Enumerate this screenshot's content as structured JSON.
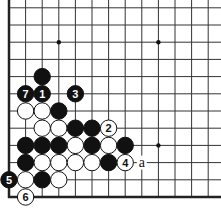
{
  "diagram": {
    "type": "go-board-fragment",
    "board_size": 19,
    "visible_corner": "bottom-left",
    "colors": {
      "background": "#ffffff",
      "line": "#333333",
      "edge": "#222222",
      "black": "#111111",
      "white": "#ffffff"
    },
    "grid": {
      "origin_x": 9,
      "origin_y": 197,
      "step_x": 16.6,
      "step_y": 17.2,
      "cols_visible": 13,
      "rows_visible": 12
    },
    "star_points": [
      {
        "col": 4,
        "row": 4
      },
      {
        "col": 10,
        "row": 4
      },
      {
        "col": 4,
        "row": 10
      },
      {
        "col": 10,
        "row": 10
      }
    ],
    "stones": [
      {
        "col": 3,
        "row": 8,
        "color": "black",
        "label": ""
      },
      {
        "col": 2,
        "row": 7,
        "color": "black",
        "label": "7"
      },
      {
        "col": 3,
        "row": 7,
        "color": "black",
        "label": "1"
      },
      {
        "col": 5,
        "row": 7,
        "color": "black",
        "label": "3"
      },
      {
        "col": 2,
        "row": 6,
        "color": "white",
        "label": ""
      },
      {
        "col": 3,
        "row": 6,
        "color": "white",
        "label": ""
      },
      {
        "col": 4,
        "row": 6,
        "color": "black",
        "label": ""
      },
      {
        "col": 3,
        "row": 5,
        "color": "white",
        "label": ""
      },
      {
        "col": 4,
        "row": 5,
        "color": "white",
        "label": ""
      },
      {
        "col": 5,
        "row": 5,
        "color": "black",
        "label": ""
      },
      {
        "col": 6,
        "row": 5,
        "color": "black",
        "label": ""
      },
      {
        "col": 7,
        "row": 5,
        "color": "white",
        "label": "2"
      },
      {
        "col": 2,
        "row": 4,
        "color": "black",
        "label": ""
      },
      {
        "col": 3,
        "row": 4,
        "color": "black",
        "label": ""
      },
      {
        "col": 4,
        "row": 4,
        "color": "black",
        "label": ""
      },
      {
        "col": 5,
        "row": 4,
        "color": "white",
        "label": ""
      },
      {
        "col": 6,
        "row": 4,
        "color": "black",
        "label": ""
      },
      {
        "col": 7,
        "row": 4,
        "color": "white",
        "label": ""
      },
      {
        "col": 8,
        "row": 4,
        "color": "black",
        "label": ""
      },
      {
        "col": 2,
        "row": 3,
        "color": "black",
        "label": ""
      },
      {
        "col": 3,
        "row": 3,
        "color": "white",
        "label": ""
      },
      {
        "col": 4,
        "row": 3,
        "color": "white",
        "label": ""
      },
      {
        "col": 5,
        "row": 3,
        "color": "white",
        "label": ""
      },
      {
        "col": 6,
        "row": 3,
        "color": "white",
        "label": ""
      },
      {
        "col": 7,
        "row": 3,
        "color": "black",
        "label": ""
      },
      {
        "col": 8,
        "row": 3,
        "color": "white",
        "label": "4"
      },
      {
        "col": 1,
        "row": 2,
        "color": "black",
        "label": "5"
      },
      {
        "col": 2,
        "row": 2,
        "color": "white",
        "label": ""
      },
      {
        "col": 3,
        "row": 2,
        "color": "black",
        "label": ""
      },
      {
        "col": 4,
        "row": 2,
        "color": "white",
        "label": ""
      },
      {
        "col": 2,
        "row": 1,
        "color": "white",
        "label": "6"
      }
    ],
    "marks": [
      {
        "col": 9,
        "row": 3,
        "label": "a"
      }
    ]
  }
}
